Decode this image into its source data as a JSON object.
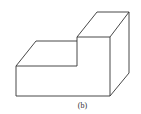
{
  "figure": {
    "caption": "(b)",
    "stroke_color": "#333333",
    "background": "#ffffff"
  }
}
